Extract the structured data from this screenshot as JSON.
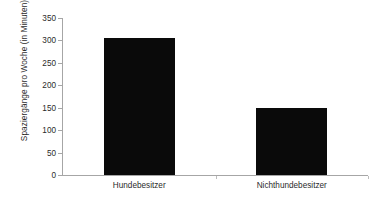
{
  "chart_data": {
    "type": "bar",
    "title": "",
    "subtitle": "",
    "xlabel": "",
    "ylabel": "Spaziergänge pro Woche (in Minuten)",
    "categories": [
      "Hundebesitzer",
      "Nichthundebesitzer"
    ],
    "values": [
      305,
      150
    ],
    "series": [
      {
        "name": "Spaziergänge pro Woche",
        "values": [
          305,
          150
        ]
      }
    ],
    "ylim": [
      0,
      350
    ],
    "yticks": [
      0,
      50,
      100,
      150,
      200,
      250,
      300,
      350
    ],
    "ytick_labels": [
      "0",
      "50",
      "100",
      "150",
      "200",
      "250",
      "300",
      "350"
    ],
    "grid": false,
    "legend": false,
    "legend_position": "none",
    "bar_color": "#0a0a0a",
    "axis_color": "#a6a6a6",
    "text_color": "#2b2b2b",
    "background_color": "#ffffff",
    "annotations": []
  }
}
